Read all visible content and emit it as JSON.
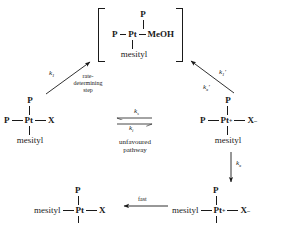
{
  "diagram": {
    "atoms": {
      "phosphine": "P",
      "platinum": "Pt",
      "platinum_cation": "Pt",
      "cation_charge": "+",
      "halide": "X",
      "halide_anion": "X",
      "anion_charge": "–",
      "methanol": "MeOH",
      "mesityl": "mesityl"
    },
    "species": {
      "intermediate": {
        "name": "methanol-solvento intermediate",
        "top": "P",
        "left": "P",
        "center": "Pt",
        "right": "MeOH",
        "bottom": "mesityl",
        "bracketed": true
      },
      "reactant": {
        "name": "neutral platinum halide",
        "top": "P",
        "left": "P",
        "center": "Pt",
        "right": "X",
        "bottom": "mesityl"
      },
      "ion_pair": {
        "name": "cationic platinum halide ion pair",
        "top": "P",
        "left": "P",
        "center": "Pt",
        "center_charge": "+",
        "right": "X",
        "right_charge": "–",
        "bottom": "mesityl"
      },
      "isomer_ion_pair": {
        "name": "isomerised cationic ion pair",
        "top": "P",
        "left": "mesityl",
        "center": "Pt",
        "center_charge": "+",
        "right": "X",
        "right_charge": "–"
      },
      "product": {
        "name": "isomerised neutral product",
        "top": "P",
        "left": "mesityl",
        "center": "Pt",
        "right": "X"
      }
    },
    "rate_constants": {
      "k1": "k",
      "k1_sub": "1",
      "k1_prime": "k",
      "k1_prime_sub": "1",
      "k1_prime_mark": "′",
      "kx_prime": "k",
      "kx_prime_sub": "x",
      "kx_prime_mark": "′",
      "kx": "k",
      "kx_sub": "x",
      "ks": "k",
      "ks_sub": "s",
      "ki": "k",
      "ki_sub": "i"
    },
    "annotations": {
      "rate_determining": "rate-\ndetermining\nstep",
      "rate_determining_line1": "rate-",
      "rate_determining_line2": "determining",
      "rate_determining_line3": "step",
      "unfavoured_line1": "unfavoured",
      "unfavoured_line2": "pathway",
      "fast": "fast"
    },
    "colors": {
      "ink": "#1a1a1a",
      "background": "#ffffff"
    }
  }
}
